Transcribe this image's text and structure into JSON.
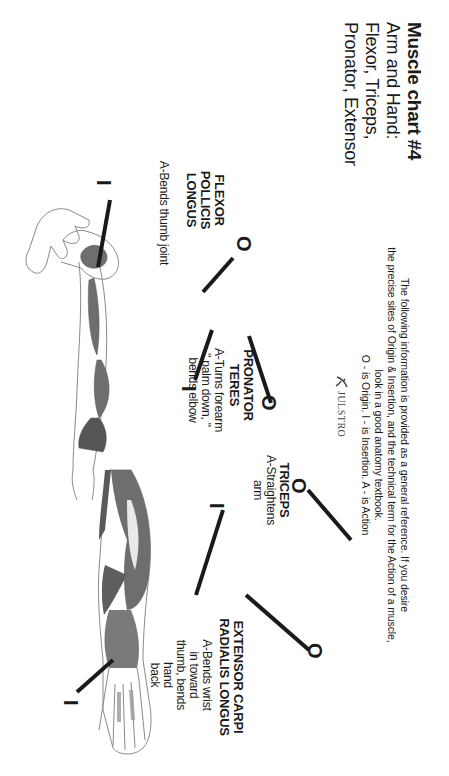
{
  "header": {
    "title": "Muscle chart #4",
    "subtitle_lines": [
      "Arm and Hand:",
      "Flexor, Triceps,",
      "Pronator, Extensor"
    ]
  },
  "info": {
    "lines": [
      "The following information is  provided as a general reference. If you desire",
      "the precise sites of Origin & Insertion, and the technical term for the Action of a muscle,",
      "look in a good anatomy textbook.",
      "O - is Origin. I - is Insertion. A - is Action"
    ]
  },
  "logo": {
    "icon": "figure-logo-icon",
    "text": "JULSTRO"
  },
  "markers": {
    "origin": "O",
    "insertion": "I"
  },
  "muscles": [
    {
      "name_lines": [
        "FLEXOR POLLICIS",
        "LONGUS"
      ],
      "action_lines": [
        "A-Bends thumb joint"
      ]
    },
    {
      "name_lines": [
        "PRONATOR",
        "TERES"
      ],
      "action_lines": [
        "A-Turns forearm",
        "\" palm down, \"",
        "bends elbow"
      ]
    },
    {
      "name_lines": [
        "TRICEPS"
      ],
      "action_lines": [
        "A-Straightens",
        "arm"
      ]
    },
    {
      "name_lines": [
        "EXTENSOR CARPI",
        "RADIALIS LONGUS"
      ],
      "action_lines": [
        "A-Bends wrist",
        "in toward",
        "thumb, bends",
        "hand",
        "back"
      ]
    }
  ],
  "colors": {
    "ink": "#1a1a1a",
    "muscle": "#6e6e6e",
    "muscle_light": "#9a9a9a",
    "outline": "#8a8a8a",
    "background": "#ffffff"
  }
}
